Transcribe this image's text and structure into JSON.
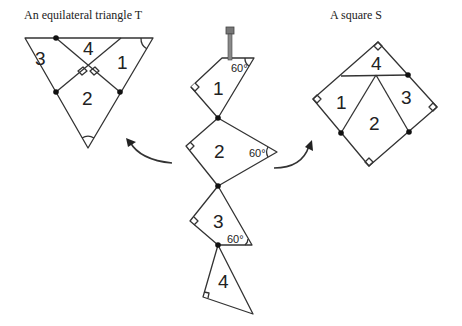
{
  "captions": {
    "triangle": "An equilateral triangle T",
    "square": "A square S"
  },
  "pieces": {
    "p1": "1",
    "p2": "2",
    "p3": "3",
    "p4": "4"
  },
  "angles": {
    "a1": "60°",
    "a2": "60°",
    "a3": "60°"
  },
  "icons": {
    "pin": "pin-icon",
    "arrow_left": "curved-arrow-left-icon",
    "arrow_right": "curved-arrow-right-icon"
  },
  "colors": {
    "line": "#333333",
    "pin": "#777777",
    "background": "#ffffff"
  }
}
